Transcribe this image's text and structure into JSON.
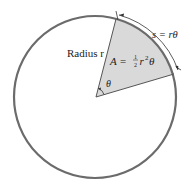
{
  "diagram": {
    "type": "circle-sector",
    "labels": {
      "radius": "Radius r",
      "area_prefix": "A =",
      "area_frac_num": "1",
      "area_frac_den": "2",
      "area_suffix_r": "r",
      "area_suffix_exp": "2",
      "area_suffix_theta": "θ",
      "arc_length": "s = rθ",
      "angle": "θ"
    },
    "colors": {
      "circle_stroke": "#6b6b6b",
      "sector_fill": "#d9d9d9",
      "line_stroke": "#555555",
      "text": "#222222"
    }
  }
}
